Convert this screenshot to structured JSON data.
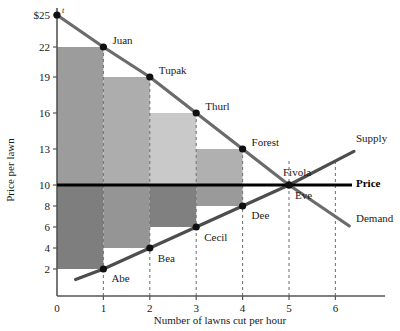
{
  "chart_data": {
    "type": "line",
    "title": "",
    "xlabel": "Number of lawns cut per hour",
    "ylabel": "Price per lawn",
    "xlim": [
      0,
      6.8
    ],
    "ylim": [
      0,
      25.8
    ],
    "xticks": [
      "0",
      "1",
      "2",
      "3",
      "4",
      "5",
      "6"
    ],
    "xtick_values": [
      0,
      1,
      2,
      3,
      4,
      5,
      6
    ],
    "yticks": [
      "2",
      "4",
      "6",
      "8",
      "10",
      "13",
      "16",
      "19",
      "22",
      "$25"
    ],
    "ytick_values": [
      2,
      4,
      6,
      8,
      10,
      13,
      16,
      19,
      22,
      25
    ],
    "grid": "dotted-vertical",
    "legend_position": "inline-right",
    "equilibrium": {
      "quantity": 5,
      "price": 10,
      "label": "Price"
    },
    "series": [
      {
        "name": "Demand",
        "label": "Demand",
        "type": "step-line",
        "x": [
          0,
          1,
          2,
          3,
          4,
          5,
          6.3
        ],
        "values": [
          25,
          22,
          19,
          16,
          13,
          10,
          6.1
        ]
      },
      {
        "name": "Supply",
        "label": "Supply",
        "type": "step-line",
        "x": [
          0.4,
          1,
          2,
          3,
          4,
          5,
          6.4
        ],
        "values": [
          1,
          2,
          4,
          6,
          8,
          10,
          12.8
        ]
      },
      {
        "name": "Price",
        "label": "Price",
        "type": "horizontal-line",
        "values": [
          10
        ]
      }
    ],
    "buyers": [
      {
        "name": "Juan",
        "quantity": 1,
        "price": 22
      },
      {
        "name": "Tupak",
        "quantity": 2,
        "price": 19
      },
      {
        "name": "Thurl",
        "quantity": 3,
        "price": 16
      },
      {
        "name": "Forest",
        "quantity": 4,
        "price": 13
      },
      {
        "name": "Fivola",
        "quantity": 5,
        "price": 10
      }
    ],
    "sellers": [
      {
        "name": "Abe",
        "quantity": 1,
        "price": 2
      },
      {
        "name": "Bea",
        "quantity": 2,
        "price": 4
      },
      {
        "name": "Cecil",
        "quantity": 3,
        "price": 6
      },
      {
        "name": "Dee",
        "quantity": 4,
        "price": 8
      },
      {
        "name": "Eve",
        "quantity": 5,
        "price": 10
      }
    ],
    "consumer_surplus_bars": [
      {
        "x0": 0,
        "x1": 1,
        "y0": 10,
        "y1": 22,
        "color": "#9c9c9c"
      },
      {
        "x0": 1,
        "x1": 2,
        "y0": 10,
        "y1": 19,
        "color": "#adadad"
      },
      {
        "x0": 2,
        "x1": 3,
        "y0": 10,
        "y1": 16,
        "color": "#c9c9c9"
      },
      {
        "x0": 3,
        "x1": 4,
        "y0": 10,
        "y1": 13,
        "color": "#b0b0b0"
      }
    ],
    "producer_surplus_bars": [
      {
        "x0": 0,
        "x1": 1,
        "y0": 2,
        "y1": 10,
        "color": "#7e7e7e"
      },
      {
        "x0": 1,
        "x1": 2,
        "y0": 4,
        "y1": 10,
        "color": "#959595"
      },
      {
        "x0": 2,
        "x1": 3,
        "y0": 6,
        "y1": 10,
        "color": "#808080"
      },
      {
        "x0": 3,
        "x1": 4,
        "y0": 8,
        "y1": 10,
        "color": "#9a9a9a"
      }
    ],
    "annotations": {
      "axis_top_marker": "t"
    },
    "colors": {
      "demand": "#6b6b6b",
      "supply": "#4d4d4d",
      "price": "#000000",
      "axis": "#555555",
      "point": "#101010"
    }
  }
}
